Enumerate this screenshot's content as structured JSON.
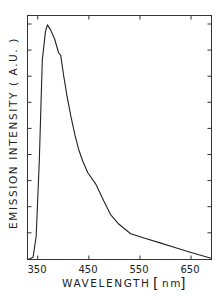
{
  "chart_data": {
    "type": "line",
    "title": "",
    "xlabel": "WAVELENGTH",
    "xunit": "nm",
    "ylabel": "EMISSION INTENSITY (A.U.)",
    "xlim": [
      330,
      690
    ],
    "ylim": [
      0,
      1.04
    ],
    "xticks": [
      350,
      450,
      550,
      650
    ],
    "xtick_labels": [
      "350",
      "450",
      "550",
      "650"
    ],
    "yticks_count": 9,
    "yticks_labeled": false,
    "grid": false,
    "legend": null,
    "series": [
      {
        "name": "emission",
        "x": [
          331,
          341,
          347,
          353,
          359,
          365,
          369,
          375,
          383,
          391,
          395,
          401,
          407,
          415,
          423,
          430,
          438,
          448,
          464,
          479,
          493,
          509,
          532,
          561,
          591,
          620,
          650,
          689
        ],
        "y": [
          0.0,
          0.01,
          0.1,
          0.42,
          0.85,
          0.97,
          1.0,
          0.98,
          0.94,
          0.88,
          0.87,
          0.78,
          0.7,
          0.61,
          0.53,
          0.47,
          0.42,
          0.37,
          0.32,
          0.25,
          0.19,
          0.15,
          0.11,
          0.09,
          0.07,
          0.05,
          0.03,
          0.005
        ]
      }
    ]
  },
  "labels": {
    "x_axis": "WAVELENGTH",
    "x_unit_open": "[",
    "x_unit": "nm",
    "x_unit_close": "]",
    "y_axis": "EMISSION INTENSITY  ( A.U. )",
    "xtick_labels": [
      "350",
      "450",
      "550",
      "650"
    ]
  },
  "style": {
    "line_color": "#222222",
    "axis_color": "#333333",
    "background": "#ffffff"
  }
}
